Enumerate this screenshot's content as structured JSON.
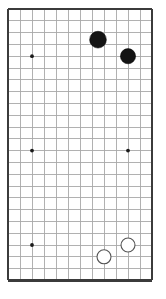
{
  "figure": {
    "type": "go-board-position",
    "width": 166,
    "height": 299
  },
  "board": {
    "columns": 13,
    "rows": 24,
    "origin_x": 8,
    "origin_y": 9,
    "spacing_x": 12,
    "spacing_y": 11.8,
    "grid_color": "#a8a8a8",
    "border_color": "#3b3b3b",
    "background_color": "#ffffff",
    "border_sides": [
      "top",
      "left",
      "right",
      "bottom"
    ]
  },
  "star_points": [
    {
      "name": "star-top-left",
      "col": 2,
      "row": 4
    },
    {
      "name": "star-top-right",
      "col": 10,
      "row": 4
    },
    {
      "name": "star-middle-left",
      "col": 2,
      "row": 12
    },
    {
      "name": "star-middle-right",
      "col": 10,
      "row": 12
    },
    {
      "name": "star-bottom-left",
      "col": 2,
      "row": 20
    },
    {
      "name": "star-bottom-right",
      "col": 10,
      "row": 20
    }
  ],
  "star_point_radius": 1.9,
  "stones": [
    {
      "name": "black-stone-1",
      "color": "black",
      "col": 7.5,
      "row": 2.6,
      "radius": 8.4,
      "fill": "#141414"
    },
    {
      "name": "black-stone-2",
      "color": "black",
      "col": 10,
      "row": 4,
      "radius": 7.6,
      "fill": "#141414"
    },
    {
      "name": "white-stone-1",
      "color": "white",
      "col": 10,
      "row": 20,
      "radius": 7.0,
      "fill": "#ffffff"
    },
    {
      "name": "white-stone-2",
      "color": "white",
      "col": 8,
      "row": 21,
      "radius": 7.0,
      "fill": "#ffffff"
    }
  ]
}
